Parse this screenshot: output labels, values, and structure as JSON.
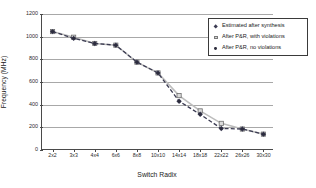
{
  "chart_data": {
    "type": "line",
    "title": "",
    "xlabel": "Switch Radix",
    "ylabel": "Frequency (MHz)",
    "ylim": [
      0,
      1200
    ],
    "ytick_labels": [
      "0",
      "200",
      "400",
      "600",
      "800",
      "1000",
      "1200"
    ],
    "ytick_values": [
      0,
      200,
      400,
      600,
      800,
      1000,
      1200
    ],
    "grid": true,
    "legend_position": "right-inside",
    "categories": [
      "2x2",
      "3x3",
      "4x4",
      "6x6",
      "8x8",
      "10x10",
      "14x14",
      "18x18",
      "22x22",
      "26x26",
      "30x30"
    ],
    "series": [
      {
        "name": "Estimated after synthesis",
        "marker": "diamond",
        "color": "#3b3b52",
        "linestyle": "dashed",
        "values": [
          1045,
          985,
          940,
          925,
          775,
          680,
          430,
          315,
          190,
          185,
          140
        ]
      },
      {
        "name": "After P&R, with violations",
        "marker": "square",
        "color": "#bdbdbd",
        "linestyle": "solid",
        "values": [
          1045,
          995,
          940,
          925,
          775,
          680,
          480,
          345,
          235,
          185,
          140
        ]
      },
      {
        "name": "After P&R, no violations",
        "marker": "dot",
        "color": "#2c2c3c",
        "linestyle": "none",
        "values": [
          1045,
          985,
          940,
          925,
          775,
          680,
          430,
          315,
          190,
          185,
          140
        ]
      }
    ]
  },
  "legend": {
    "items": [
      {
        "label": "Estimated after synthesis",
        "marker_name": "diamond-marker-icon"
      },
      {
        "label": "After P&R, with violations",
        "marker_name": "square-marker-icon"
      },
      {
        "label": "After P&R, no violations",
        "marker_name": "dot-marker-icon"
      }
    ]
  },
  "axes": {
    "y_title": "Frequency (MHz)",
    "x_title": "Switch Radix"
  }
}
